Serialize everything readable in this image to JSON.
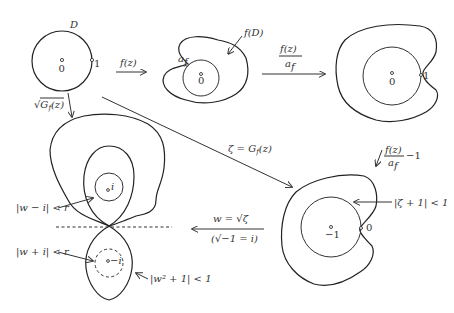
{
  "figure": {
    "panel_unit_disk": {
      "domain_label": "D",
      "center_label": "0",
      "boundary_point_label": "1"
    },
    "arrow_f": {
      "label": "f(z)"
    },
    "panel_image": {
      "region_label": "f(D)",
      "point_label": "a_f",
      "point_label_main": "a",
      "point_label_sub": "f",
      "center_label": "0"
    },
    "arrow_normalize": {
      "numerator": "f(z)",
      "denominator": "a_f",
      "denominator_main": "a",
      "denominator_sub": "f"
    },
    "panel_normalized": {
      "center_label": "0",
      "boundary_point_label": "1"
    },
    "arrow_shift": {
      "numerator": "f(z)",
      "denominator_main": "a",
      "denominator_sub": "f",
      "suffix": "−1"
    },
    "arrow_G": {
      "label_lhs": "ζ = G",
      "label_sub": "f",
      "label_rhs": "(z)"
    },
    "panel_zeta": {
      "disk_label": "|ζ + 1| < 1",
      "center_label": "−1",
      "boundary_point_label": "0"
    },
    "arrow_sqrt_zeta": {
      "label_top": "w = √ζ",
      "label_bottom": "(√−1 = i)"
    },
    "arrow_sqrt_G": {
      "label_main": "√G",
      "label_sub": "f",
      "label_rhs": "(z)"
    },
    "panel_w": {
      "upper_point_label": "i",
      "lower_point_label": "−i",
      "upper_disk_label": "|w − i| < r",
      "lower_disk_label": "|w + i| < r",
      "lemniscate_label": "|w² + 1| < 1"
    }
  }
}
